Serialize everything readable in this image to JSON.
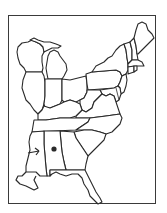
{
  "map": {
    "region": "Eastern United States",
    "style": "outline",
    "colors": {
      "outline": "#2a2a2a",
      "fill": "#ffffff",
      "frame": "#3a3a3a",
      "marker": "#2a2a2a"
    },
    "states": [
      "Wisconsin",
      "Michigan",
      "Illinois",
      "Indiana",
      "Ohio",
      "Kentucky",
      "Tennessee",
      "Mississippi",
      "Alabama",
      "Georgia",
      "Florida",
      "South Carolina",
      "North Carolina",
      "Virginia",
      "West Virginia",
      "Pennsylvania",
      "New York",
      "Maryland",
      "Delaware",
      "New Jersey",
      "Vermont",
      "New Hampshire",
      "Maine",
      "Massachusetts",
      "Connecticut",
      "Rhode Island"
    ],
    "markers": [
      {
        "type": "dot",
        "state": "Alabama"
      },
      {
        "type": "arrow",
        "state": "Mississippi",
        "points_toward": "Alabama"
      }
    ]
  }
}
